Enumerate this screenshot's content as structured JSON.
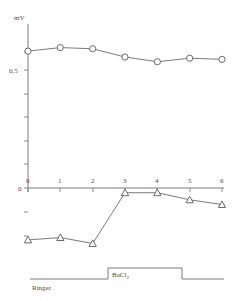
{
  "chart_data": {
    "type": "line",
    "title": "",
    "xlabel": "",
    "ylabel": "mV",
    "ylabel_text": "mV",
    "xlim": [
      0,
      6
    ],
    "ylim": [
      -0.28,
      0.64
    ],
    "grid": false,
    "legend": "none",
    "x": [
      0,
      1,
      2,
      3,
      4,
      5,
      6
    ],
    "xtick_labels": [
      "0",
      "1",
      "2",
      "3",
      "4",
      "5",
      "6"
    ],
    "ytick_labels": [
      "0.5",
      "0"
    ],
    "ytick_values": [
      0.5,
      0
    ],
    "series": [
      {
        "name": "upper-circles",
        "marker": "circle",
        "values": [
          0.58,
          0.595,
          0.59,
          0.555,
          0.535,
          0.55,
          0.545
        ]
      },
      {
        "name": "lower-triangles",
        "marker": "triangle",
        "values": [
          -0.22,
          -0.21,
          -0.235,
          -0.02,
          -0.02,
          -0.05,
          -0.07
        ]
      }
    ],
    "annotations": [
      {
        "name": "protocol-bacl2",
        "text": "BaCl",
        "subscript": "2",
        "x_start": 2.5,
        "x_end": 4.5
      },
      {
        "name": "protocol-ringer",
        "text": "Ringer",
        "x_start": 0,
        "x_end": 6
      }
    ]
  },
  "labels": {
    "y_axis_unit": "mV",
    "y_tick_0_5": "0.5",
    "y_tick_0": "0",
    "x_0": "0",
    "x_1": "1",
    "x_2": "2",
    "x_3": "3",
    "x_4": "4",
    "x_5": "5",
    "x_6": "6",
    "bacl2_main": "BaCl",
    "bacl2_sub": "2",
    "ringer": "Ringer"
  },
  "colors": {
    "axis": "#7a7a7a",
    "line": "#6b6b6b",
    "marker_fill": "#ffffff",
    "text": "#4a4a4a",
    "background": "#ffffff"
  }
}
